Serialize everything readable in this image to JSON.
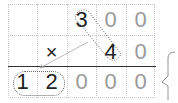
{
  "problem": {
    "row1": [
      "",
      "",
      "3",
      "0",
      "0"
    ],
    "row2": [
      "",
      "×",
      "",
      "4",
      "0"
    ],
    "result": [
      "1",
      "2",
      "0",
      "0",
      "0"
    ]
  },
  "colors": {
    "dark": "#222222",
    "grey": "#9a9a9a",
    "grid": "#c8c8c8"
  },
  "brace_label": "ㅁ"
}
